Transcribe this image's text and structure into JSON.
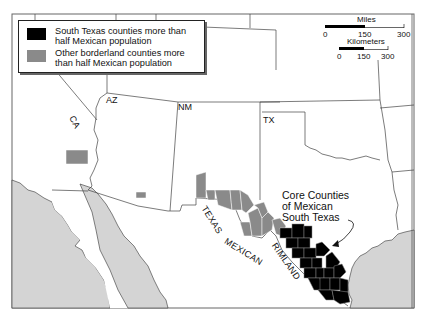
{
  "legend": {
    "items": [
      {
        "label": "South Texas counties more than half Mexican population",
        "color": "#000000"
      },
      {
        "label": "Other borderland counties more than half Mexican population",
        "color": "#8a8a8a"
      }
    ]
  },
  "scale": {
    "miles_label": "Miles",
    "miles_ticks": [
      "0",
      "150",
      "300"
    ],
    "km_label": "Kilometers",
    "km_ticks": [
      "0",
      "150",
      "300"
    ]
  },
  "state_labels": {
    "ca": "CA",
    "az": "AZ",
    "nm": "NM",
    "tx": "TX"
  },
  "region_labels": {
    "texas": "TEXAS",
    "mexican": "MEXICAN",
    "rimland": "RIMLAND"
  },
  "callout": {
    "line1": "Core Counties",
    "line2": "of Mexican",
    "line3": "South Texas"
  },
  "colors": {
    "core_counties": "#000000",
    "borderland_counties": "#8a8a8a",
    "water": "#d4d4d4",
    "land": "#ffffff",
    "boundary": "#444444"
  }
}
